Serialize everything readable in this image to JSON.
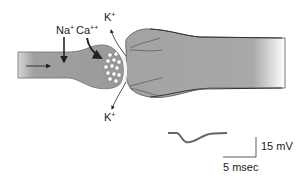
{
  "diagram": {
    "type": "synaptic terminal schematic",
    "labels": {
      "na": "Na",
      "na_charge": "+",
      "ca": "Ca",
      "ca_charge": "++",
      "k_top": "K",
      "k_top_charge": "+",
      "k_bottom": "K",
      "k_bottom_charge": "+"
    },
    "scale_bar": {
      "voltage_label": "15 mV",
      "time_label": "5 msec"
    },
    "colors": {
      "axon_fill": "#9a9a9a",
      "axon_edge": "#6e6e6e",
      "postsynaptic_fill": "#a6a6a6",
      "arrow": "#222222",
      "trace": "#666666",
      "vesicle": "#ffffff"
    }
  }
}
